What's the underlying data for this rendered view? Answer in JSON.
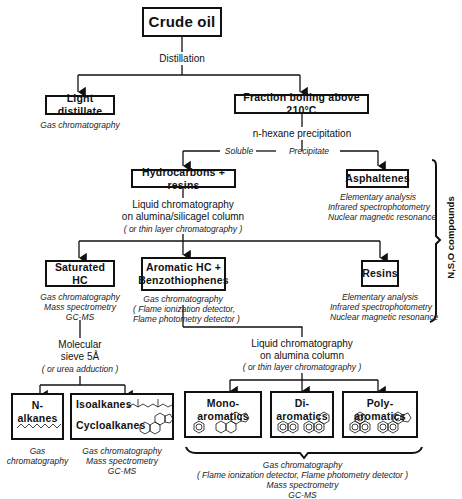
{
  "nodes": {
    "crude_oil": "Crude oil",
    "light_distillate": "Light distillate",
    "fraction_boiling": "Fraction boiling above 210°C",
    "hydrocarbons_resins": "Hydrocarbons + resins",
    "asphaltenes": "Asphaltenes",
    "saturated_hc": "Saturated HC",
    "aromatic_hc_1": "Aromatic HC +",
    "aromatic_hc_2": "Benzothiophenes",
    "resins": "Resins",
    "n_alkanes": "N-alkanes",
    "isoalkanes": "Isoalkanes",
    "cycloalkanes": "Cycloalkanes",
    "mono_aromatics": "Mono-aromatics",
    "di_aromatics": "Di-aromatics",
    "poly_aromatics": "Poly-aromatics"
  },
  "steps": {
    "distillation": "Distillation",
    "n_hexane": "n-hexane precipitation",
    "soluble": "Soluble",
    "precipitate": "Precipitate",
    "lc1_line1": "Liquid chromatography",
    "lc1_line2": "on alumina/silicagel column",
    "lc1_note": "( or thin layer chromatography )",
    "sieve_line1": "Molecular",
    "sieve_line2": "sieve 5Å",
    "sieve_note": "( or urea adduction )",
    "lc2_line1": "Liquid chromatography",
    "lc2_line2": "on alumina column",
    "lc2_note": "( or thin layer chromatography )"
  },
  "methods": {
    "light_distillate": "Gas chromatography",
    "asphaltenes": [
      "Elementary analysis",
      "Infrared spectrophotometry",
      "Nuclear magnetic resonance"
    ],
    "saturated_hc": [
      "Gas chromatography",
      "Mass spectrometry",
      "GC-MS"
    ],
    "aromatic_hc": [
      "Gas chromatography",
      "( Flame ionization detector,",
      "Flame photometry detector )"
    ],
    "resins": [
      "Elementary analysis",
      "Infrared spectrophotometry",
      "Nuclear magnetic resonance"
    ],
    "n_alkanes": [
      "Gas",
      "chromatography"
    ],
    "iso_cyclo": [
      "Gas chromatography",
      "Mass spectrometry",
      "GC-MS"
    ],
    "aromatics_all": [
      "Gas chromatography",
      "( Flame ionization detector, Flame photometry detector )",
      "Mass spectrometry",
      "GC-MS"
    ]
  },
  "bracket_label": "N,S,O compounds"
}
